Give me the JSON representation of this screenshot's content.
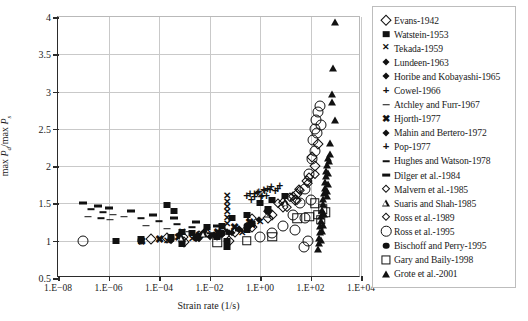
{
  "chart_data": {
    "type": "scatter",
    "title": "",
    "xlabel": "Strain rate (1/s)",
    "ylabel": "max Pd/max Ps",
    "ylabel_parts": {
      "prefix": "max ",
      "num": "P",
      "num_sub": "d",
      "slash": "/max ",
      "den": "P",
      "den_sub": "s"
    },
    "xscale": "log",
    "xlim": [
      1e-08,
      10000.0
    ],
    "ylim": [
      0.5,
      4
    ],
    "grid": true,
    "legend_position": "right-outside",
    "xticks": [
      {
        "value": 1e-08,
        "label": "1.E−08"
      },
      {
        "value": 1e-06,
        "label": "1.E−06"
      },
      {
        "value": 0.0001,
        "label": "1.E−04"
      },
      {
        "value": 0.01,
        "label": "1.E−02"
      },
      {
        "value": 1,
        "label": "1.E+00"
      },
      {
        "value": 100,
        "label": "1.E+02"
      },
      {
        "value": 10000,
        "label": "1.E+04"
      }
    ],
    "yticks": [
      {
        "value": 0.5,
        "label": "0.5"
      },
      {
        "value": 1,
        "label": "1"
      },
      {
        "value": 1.5,
        "label": "1.5"
      },
      {
        "value": 2,
        "label": "2"
      },
      {
        "value": 2.5,
        "label": "2.5"
      },
      {
        "value": 3,
        "label": "3"
      },
      {
        "value": 3.5,
        "label": "3.5"
      },
      {
        "value": 4,
        "label": "4"
      }
    ],
    "series": [
      {
        "name": "Evans-1942",
        "marker": "diamond-open",
        "points": [
          [
            5e-05,
            1.02
          ],
          [
            0.0002,
            1.03
          ],
          [
            0.0009,
            1.05
          ],
          [
            0.004,
            1.06
          ],
          [
            0.02,
            1.08
          ],
          [
            0.1,
            1.12
          ],
          [
            0.5,
            1.18
          ],
          [
            2,
            1.3
          ],
          [
            8,
            1.45
          ],
          [
            30,
            1.62
          ],
          [
            70,
            1.8
          ],
          [
            150,
            2.0
          ],
          [
            0.001,
            0.98
          ],
          [
            0.06,
            1.0
          ],
          [
            3,
            1.35
          ],
          [
            25,
            1.55
          ],
          [
            120,
            2.12
          ],
          [
            200,
            2.3
          ]
        ]
      },
      {
        "name": "Watstein-1953",
        "marker": "square-filled",
        "points": [
          [
            2e-06,
            1.0
          ],
          [
            2e-05,
            1.02
          ],
          [
            0.0003,
            1.05
          ],
          [
            0.0008,
            1.12
          ],
          [
            0.0008,
            0.95
          ],
          [
            0.002,
            1.1
          ],
          [
            0.008,
            1.18
          ],
          [
            0.03,
            1.2
          ],
          [
            0.08,
            1.3
          ],
          [
            0.3,
            1.35
          ],
          [
            1,
            1.5
          ],
          [
            3,
            1.55
          ],
          [
            10,
            1.6
          ],
          [
            0.0002,
            1.48
          ],
          [
            0.0004,
            1.4
          ],
          [
            0.05,
            1.0
          ],
          [
            0.05,
            0.92
          ],
          [
            0.5,
            1.22
          ],
          [
            2,
            1.42
          ],
          [
            0.02,
            1.05
          ],
          [
            0.3,
            1.15
          ]
        ]
      },
      {
        "name": "Tekada-1959",
        "marker": "x",
        "points": [
          [
            2e-05,
            0.98
          ],
          [
            0.0002,
            1.0
          ],
          [
            0.002,
            1.02
          ],
          [
            0.02,
            1.05
          ],
          [
            0.2,
            1.1
          ],
          [
            0.05,
            1.22
          ],
          [
            0.05,
            1.3
          ],
          [
            0.05,
            1.38
          ],
          [
            0.05,
            1.45
          ],
          [
            0.05,
            1.52
          ],
          [
            0.05,
            1.6
          ],
          [
            0.5,
            1.2
          ],
          [
            1,
            1.25
          ],
          [
            0.008,
            1.15
          ],
          [
            0.0008,
            1.12
          ]
        ]
      },
      {
        "name": "Lundeen-1963",
        "marker": "diamond-filled",
        "points": [
          [
            0.0003,
            1.0
          ],
          [
            0.003,
            1.02
          ],
          [
            0.01,
            1.05
          ],
          [
            0.03,
            1.08
          ],
          [
            0.08,
            1.1
          ],
          [
            0.0006,
            1.08
          ],
          [
            0.006,
            1.12
          ]
        ]
      },
      {
        "name": "Horibe and Kobayashi-1965",
        "marker": "diamond-filled",
        "points": [
          [
            0.004,
            1.02
          ],
          [
            0.02,
            1.06
          ],
          [
            0.06,
            1.1
          ],
          [
            0.15,
            1.14
          ],
          [
            0.4,
            1.2
          ],
          [
            0.9,
            1.28
          ]
        ]
      },
      {
        "name": "Cowel-1966",
        "marker": "plus",
        "points": [
          [
            0.3,
            1.6
          ],
          [
            0.6,
            1.62
          ],
          [
            0.9,
            1.65
          ],
          [
            1.4,
            1.68
          ],
          [
            2,
            1.7
          ],
          [
            2.8,
            1.72
          ],
          [
            0.45,
            1.55
          ],
          [
            1.1,
            1.58
          ],
          [
            1.8,
            1.6
          ],
          [
            4,
            1.66
          ],
          [
            6,
            1.74
          ]
        ]
      },
      {
        "name": "Atchley and Furr-1967",
        "marker": "minus",
        "points": [
          [
            2e-07,
            1.42
          ],
          [
            6e-07,
            1.38
          ],
          [
            1.5e-06,
            1.35
          ],
          [
            4e-06,
            1.32
          ],
          [
            2e-05,
            1.3
          ],
          [
            0.0001,
            1.26
          ],
          [
            0.0005,
            1.22
          ],
          [
            0.002,
            1.18
          ]
        ]
      },
      {
        "name": "Hjorth-1977",
        "marker": "x-bold",
        "points": [
          [
            2e-05,
            1.0
          ],
          [
            0.0001,
            1.02
          ],
          [
            0.0006,
            1.05
          ],
          [
            0.004,
            1.08
          ],
          [
            0.02,
            1.12
          ],
          [
            0.1,
            1.18
          ],
          [
            0.4,
            1.25
          ]
        ]
      },
      {
        "name": "Mahin and Bertero-1972",
        "marker": "diamond-filled",
        "points": [
          [
            0.0008,
            1.0
          ],
          [
            0.004,
            1.04
          ],
          [
            0.015,
            1.08
          ],
          [
            0.05,
            1.12
          ],
          [
            0.15,
            1.16
          ],
          [
            0.5,
            1.22
          ]
        ]
      },
      {
        "name": "Pop-1977",
        "marker": "plus",
        "points": [
          [
            0.4,
            1.62
          ],
          [
            0.8,
            1.64
          ],
          [
            1.5,
            1.66
          ],
          [
            2.5,
            1.68
          ],
          [
            5,
            1.7
          ],
          [
            0.6,
            1.58
          ],
          [
            1.2,
            1.6
          ]
        ]
      },
      {
        "name": "Hughes and Watson-1978",
        "marker": "minus",
        "points": [
          [
            1.5e-07,
            1.32
          ],
          [
            5e-07,
            1.3
          ],
          [
            1.2e-06,
            1.28
          ],
          [
            3e-05,
            1.2
          ],
          [
            0.0002,
            1.16
          ],
          [
            0.0015,
            1.12
          ],
          [
            0.01,
            1.1
          ]
        ]
      },
      {
        "name": "Dilger et al.-1984",
        "marker": "thick-dash",
        "points": [
          [
            1e-07,
            1.5
          ],
          [
            4e-07,
            1.46
          ],
          [
            1e-06,
            1.44
          ],
          [
            8e-06,
            1.4
          ],
          [
            6e-05,
            1.35
          ],
          [
            0.0004,
            1.3
          ],
          [
            0.003,
            1.25
          ],
          [
            0.02,
            1.2
          ],
          [
            0.15,
            1.15
          ]
        ]
      },
      {
        "name": "Malvern et al.-1985",
        "marker": "diamond-open-small",
        "points": [
          [
            8,
            1.52
          ],
          [
            20,
            1.6
          ],
          [
            40,
            1.68
          ],
          [
            80,
            1.78
          ],
          [
            150,
            1.9
          ],
          [
            12,
            1.45
          ],
          [
            30,
            1.55
          ]
        ]
      },
      {
        "name": "Suaris and Shah-1985",
        "marker": "triangle-open",
        "points": [
          [
            0.0008,
            1.02
          ],
          [
            0.006,
            1.08
          ],
          [
            0.04,
            1.12
          ],
          [
            0.3,
            1.2
          ],
          [
            2,
            1.35
          ],
          [
            10,
            1.5
          ]
        ]
      },
      {
        "name": "Ross et al.-1989",
        "marker": "diamond-open-small",
        "points": [
          [
            5,
            1.5
          ],
          [
            15,
            1.58
          ],
          [
            35,
            1.7
          ],
          [
            90,
            1.85
          ],
          [
            0.5,
            1.3
          ],
          [
            2,
            1.4
          ]
        ]
      },
      {
        "name": "Ross et al.-1995",
        "marker": "circle-open",
        "points": [
          [
            1e-07,
            1.0
          ],
          [
            1,
            1.05
          ],
          [
            3,
            1.1
          ],
          [
            8,
            1.2
          ],
          [
            20,
            1.35
          ],
          [
            40,
            1.5
          ],
          [
            60,
            1.7
          ],
          [
            90,
            1.9
          ],
          [
            110,
            2.1
          ],
          [
            130,
            2.35
          ],
          [
            150,
            2.5
          ],
          [
            170,
            2.62
          ],
          [
            200,
            2.72
          ],
          [
            230,
            2.8
          ],
          [
            60,
            1.3
          ],
          [
            100,
            1.55
          ],
          [
            150,
            2.2
          ],
          [
            180,
            2.45
          ],
          [
            250,
            2.55
          ],
          [
            25,
            1.15
          ],
          [
            55,
            0.92
          ],
          [
            80,
            1.0
          ]
        ]
      },
      {
        "name": "Bischoff and Perry-1995",
        "marker": "circle-filled",
        "points": [
          [
            2e-05,
            1.0
          ],
          [
            0.0003,
            1.02
          ],
          [
            0.003,
            1.05
          ],
          [
            0.03,
            1.1
          ],
          [
            0.3,
            1.2
          ],
          [
            2,
            1.4
          ]
        ]
      },
      {
        "name": "Gary and Baily-1998",
        "marker": "square-open",
        "points": [
          [
            0.02,
            0.98
          ],
          [
            0.3,
            1.0
          ],
          [
            3,
            1.05
          ],
          [
            30,
            1.3
          ],
          [
            90,
            1.32
          ],
          [
            200,
            1.35
          ],
          [
            300,
            1.42
          ],
          [
            150,
            1.5
          ],
          [
            400,
            1.38
          ],
          [
            250,
            1.28
          ]
        ]
      },
      {
        "name": "Grote et al.-2001",
        "marker": "triangle-filled",
        "points": [
          [
            900,
            3.92
          ],
          [
            800,
            3.3
          ],
          [
            700,
            2.95
          ],
          [
            700,
            2.85
          ],
          [
            900,
            2.6
          ],
          [
            600,
            2.3
          ],
          [
            500,
            2.1
          ],
          [
            450,
            2.0
          ],
          [
            420,
            1.92
          ],
          [
            400,
            1.85
          ],
          [
            380,
            1.78
          ],
          [
            360,
            1.7
          ],
          [
            340,
            1.62
          ],
          [
            320,
            1.55
          ],
          [
            300,
            1.48
          ],
          [
            280,
            1.4
          ],
          [
            260,
            1.32
          ],
          [
            250,
            1.25
          ],
          [
            240,
            1.18
          ],
          [
            230,
            1.1
          ],
          [
            220,
            1.02
          ],
          [
            210,
            0.95
          ],
          [
            200,
            0.88
          ],
          [
            500,
            1.9
          ],
          [
            480,
            1.75
          ],
          [
            460,
            1.65
          ],
          [
            440,
            1.58
          ],
          [
            350,
            1.35
          ],
          [
            300,
            1.2
          ],
          [
            280,
            1.12
          ],
          [
            260,
            1.0
          ],
          [
            600,
            2.15
          ],
          [
            550,
            2.05
          ]
        ]
      }
    ]
  },
  "legend": {
    "items": [
      {
        "label": "Evans-1942",
        "marker": "diamond-open"
      },
      {
        "label": "Watstein-1953",
        "marker": "square-filled"
      },
      {
        "label": "Tekada-1959",
        "marker": "x"
      },
      {
        "label": "Lundeen-1963",
        "marker": "diamond-filled"
      },
      {
        "label": "Horibe and Kobayashi-1965",
        "marker": "diamond-filled"
      },
      {
        "label": "Cowel-1966",
        "marker": "plus"
      },
      {
        "label": "Atchley and Furr-1967",
        "marker": "minus"
      },
      {
        "label": "Hjorth-1977",
        "marker": "x-bold"
      },
      {
        "label": "Mahin and Bertero-1972",
        "marker": "diamond-filled"
      },
      {
        "label": "Pop-1977",
        "marker": "plus"
      },
      {
        "label": "Hughes and Watson-1978",
        "marker": "minus"
      },
      {
        "label": "Dilger et al.-1984",
        "marker": "thick-dash"
      },
      {
        "label": "Malvern et al.-1985",
        "marker": "diamond-open-small"
      },
      {
        "label": "Suaris and Shah-1985",
        "marker": "triangle-open"
      },
      {
        "label": "Ross et al.-1989",
        "marker": "diamond-open-small"
      },
      {
        "label": "Ross et al.-1995",
        "marker": "circle-open"
      },
      {
        "label": "Bischoff and Perry-1995",
        "marker": "circle-filled"
      },
      {
        "label": "Gary and Baily-1998",
        "marker": "square-open"
      },
      {
        "label": "Grote et al.-2001",
        "marker": "triangle-filled"
      }
    ]
  },
  "colors": {
    "ink": "#111111",
    "grid": "#c9c9c9",
    "axis": "#2b2b2b",
    "background": "#ffffff"
  }
}
